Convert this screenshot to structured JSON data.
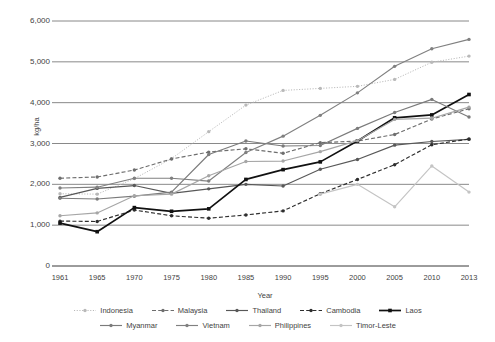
{
  "chart_data": {
    "type": "line",
    "title": "",
    "xlabel": "Year",
    "ylabel": "kg/ha",
    "x": [
      1961,
      1965,
      1970,
      1975,
      1980,
      1985,
      1990,
      1995,
      2000,
      2005,
      2010,
      2013
    ],
    "xticklabels": [
      "1961",
      "1965",
      "1970",
      "1975",
      "1980",
      "1985",
      "1990",
      "1995",
      "2000",
      "2005",
      "2010",
      "2013"
    ],
    "yticklabels": [
      "0",
      "1,000",
      "2,000",
      "3,000",
      "4,000",
      "5,000",
      "6,000"
    ],
    "yticks": [
      0,
      1000,
      2000,
      3000,
      4000,
      5000,
      6000
    ],
    "ylim": [
      0,
      6000
    ],
    "grid": "horizontal",
    "legend_position": "bottom",
    "series": [
      {
        "name": "Indonesia",
        "color": "#b9b9b9",
        "style": "dotted",
        "marker": "circle",
        "values": [
          1770,
          1760,
          2140,
          2630,
          3290,
          3940,
          4300,
          4350,
          4400,
          4570,
          4990,
          5140
        ]
      },
      {
        "name": "Malaysia",
        "color": "#6e6e6e",
        "style": "dashed",
        "marker": "circle",
        "values": [
          2150,
          2180,
          2350,
          2620,
          2790,
          2870,
          2760,
          3020,
          3060,
          3220,
          3600,
          3850
        ]
      },
      {
        "name": "Thailand",
        "color": "#585858",
        "style": "solid",
        "marker": "circle",
        "values": [
          1680,
          1900,
          1970,
          1780,
          1890,
          2000,
          1960,
          2370,
          2610,
          2960,
          3050,
          3100
        ]
      },
      {
        "name": "Cambodia",
        "color": "#2e2e2e",
        "style": "dashed",
        "marker": "circle",
        "values": [
          1100,
          1090,
          1370,
          1230,
          1170,
          1250,
          1350,
          1770,
          2120,
          2480,
          2970,
          3110
        ]
      },
      {
        "name": "Laos",
        "color": "#111111",
        "style": "solid",
        "marker": "square",
        "values": [
          1050,
          840,
          1430,
          1340,
          1400,
          2120,
          2360,
          2550,
          3060,
          3630,
          3700,
          4200
        ]
      },
      {
        "name": "Myanmar",
        "color": "#7b7b7b",
        "style": "solid",
        "marker": "circle",
        "values": [
          1660,
          1640,
          1710,
          1810,
          2730,
          3060,
          2940,
          2950,
          3370,
          3760,
          4080,
          3650
        ]
      },
      {
        "name": "Vietnam",
        "color": "#808080",
        "style": "solid",
        "marker": "circle",
        "values": [
          1910,
          1930,
          2150,
          2150,
          2080,
          2780,
          3180,
          3690,
          4240,
          4890,
          5320,
          5550
        ]
      },
      {
        "name": "Philippines",
        "color": "#a6a6a6",
        "style": "solid",
        "marker": "circle",
        "values": [
          1230,
          1300,
          1720,
          1760,
          2210,
          2560,
          2570,
          2800,
          3070,
          3590,
          3620,
          3890
        ]
      },
      {
        "name": "Timor-Leste",
        "color": "#c4c4c4",
        "style": "solid",
        "marker": "circle",
        "values": [
          null,
          null,
          null,
          null,
          null,
          null,
          null,
          1760,
          2000,
          1450,
          2450,
          1810
        ]
      }
    ]
  }
}
